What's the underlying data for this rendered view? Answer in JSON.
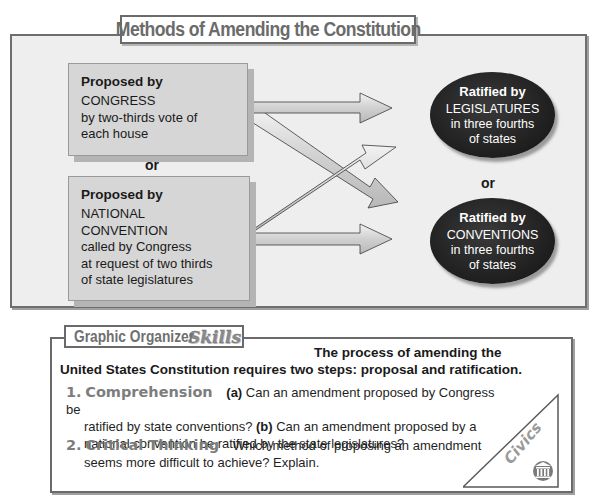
{
  "diagram": {
    "title": "Methods of Amending the Constitution",
    "proposal_methods": [
      {
        "header": "Proposed by",
        "lines": [
          "CONGRESS",
          "by two-thirds vote of",
          "each house"
        ]
      },
      {
        "header": "Proposed by",
        "lines": [
          "NATIONAL",
          "CONVENTION",
          "called by Congress",
          "at request of two thirds",
          "of state legislatures"
        ]
      }
    ],
    "proposal_separator": "or",
    "ratification_methods": [
      {
        "header": "Ratified by",
        "lines": [
          "LEGISLATURES",
          "in three fourths",
          "of states"
        ]
      },
      {
        "header": "Ratified by",
        "lines": [
          "CONVENTIONS",
          "in three fourths",
          "of states"
        ]
      }
    ],
    "ratification_separator": "or",
    "colors": {
      "panel_bg": "#eeeeee",
      "proposal_box": "#d6d6d6",
      "ellipse": "#1e1e1e",
      "title_text": "#6b6b6b"
    }
  },
  "organizer": {
    "title": "Graphic Organizer",
    "title_accent": "Skills",
    "intro_line1": "The process of amending the",
    "intro_line2": "United States Constitution requires two steps: proposal and ratification.",
    "questions": [
      {
        "number": "1.",
        "label": "Comprehension",
        "part_a_marker": "(a)",
        "part_a_text": " Can an amendment proposed by Congress be",
        "part_a_cont": "ratified by state conventions? ",
        "part_b_marker": "(b)",
        "part_b_text": " Can an amendment proposed by a",
        "part_b_cont": "national convention be ratified by the state legislatures?"
      },
      {
        "number": "2.",
        "label": "Critical Thinking",
        "text": "Which method of proposing an amendment",
        "text_cont": "seems more difficult to achieve? Explain."
      }
    ],
    "tab_label": "Civics",
    "tab_icon": "capitol-columns-icon"
  }
}
